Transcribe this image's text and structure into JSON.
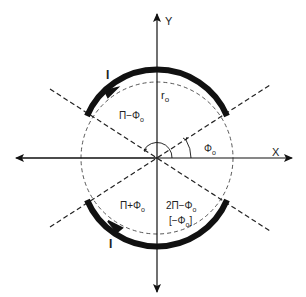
{
  "diagram": {
    "axes": {
      "x_label": "X",
      "y_label": "Y"
    },
    "radius_label": "r",
    "radius_sub": "o",
    "current_label_top": "I",
    "current_label_bottom": "I",
    "regions": {
      "upper_left": {
        "main": "Π−Φ",
        "sub": "o"
      },
      "right": {
        "main": "Φ",
        "sub": "o"
      },
      "lower_left": {
        "main": "Π+Φ",
        "sub": "o"
      },
      "lower_right_line1": {
        "main": "2Π−Φ",
        "sub": "o"
      },
      "lower_right_line2": {
        "open": "[−Φ",
        "sub": "o",
        "close": "]"
      }
    },
    "colors": {
      "ink": "#111111",
      "dashed": "#333333",
      "background": "#ffffff"
    }
  }
}
